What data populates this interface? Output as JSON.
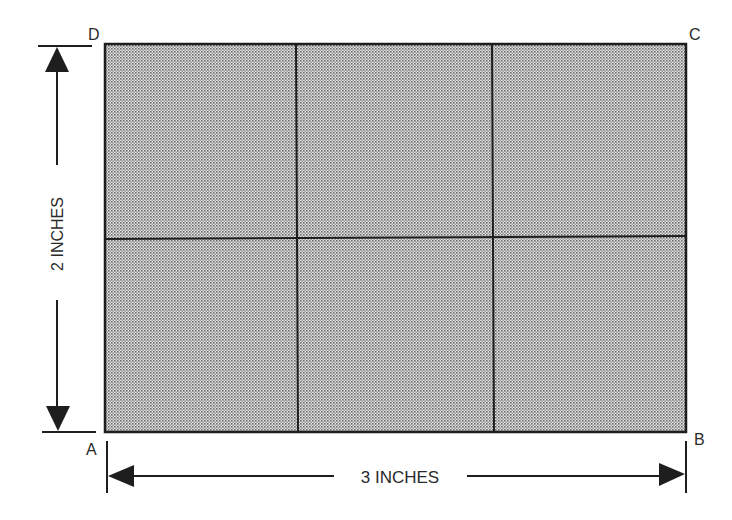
{
  "diagram": {
    "corners": {
      "a": "A",
      "b": "B",
      "c": "C",
      "d": "D"
    },
    "height_label": "2 INCHES",
    "width_label": "3 INCHES",
    "grid": {
      "columns": 3,
      "rows": 2
    },
    "colors": {
      "fill": "#c9c9c9",
      "line": "#1e1e1e",
      "text": "#2a2a2a"
    }
  }
}
